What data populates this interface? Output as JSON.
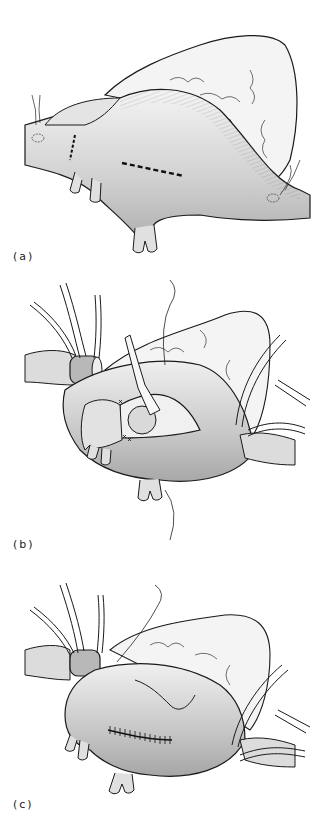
{
  "figure": {
    "panels": [
      {
        "id": "a",
        "label": "(a)",
        "description": "Aneurysmal vessel segment with planned incision line (dashed) and transection mark"
      },
      {
        "id": "b",
        "label": "(b)",
        "description": "Vessel opened with retractor, cannulas and clamps placed, sutures along margin"
      },
      {
        "id": "c",
        "label": "(c)",
        "description": "Incision closed with running suture; cannulas and vessel loops in place"
      }
    ]
  },
  "colors": {
    "line": "#1a1a1a",
    "fill_light": "#f2f2f2",
    "fill_mid": "#d6d6d6",
    "fill_dark": "#a8a8a8",
    "background": "#ffffff"
  }
}
